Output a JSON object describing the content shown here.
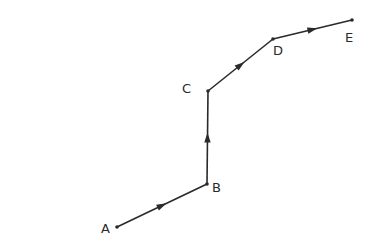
{
  "diagram": {
    "type": "directed-path",
    "stroke_color": "#2a2a2a",
    "background": "#ffffff",
    "points": [
      {
        "id": "A",
        "label": "A",
        "x": 117,
        "y": 227,
        "lx": 101,
        "ly": 233
      },
      {
        "id": "B",
        "label": "B",
        "x": 207,
        "y": 184,
        "lx": 212,
        "ly": 192
      },
      {
        "id": "C",
        "label": "C",
        "x": 208,
        "y": 91,
        "lx": 182,
        "ly": 93
      },
      {
        "id": "D",
        "label": "D",
        "x": 273,
        "y": 39,
        "lx": 273,
        "ly": 55
      },
      {
        "id": "E",
        "label": "E",
        "x": 352,
        "y": 20,
        "lx": 345,
        "ly": 42
      }
    ],
    "segments": [
      {
        "from": "A",
        "to": "B"
      },
      {
        "from": "B",
        "to": "C"
      },
      {
        "from": "C",
        "to": "D"
      },
      {
        "from": "D",
        "to": "E"
      }
    ]
  }
}
